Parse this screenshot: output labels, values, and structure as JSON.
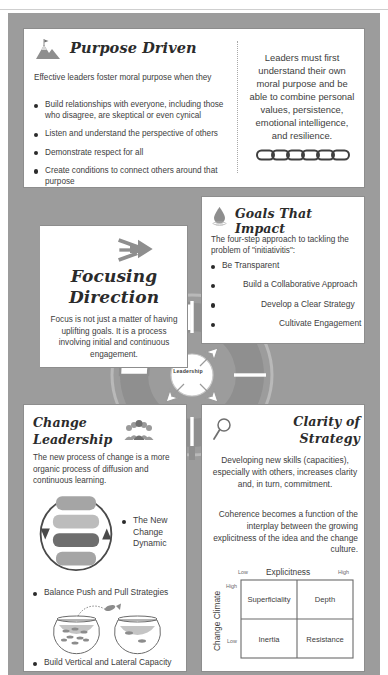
{
  "theme": {
    "frame_gray": "#9c9c9c",
    "ring_gray": "#8f8f8f",
    "card_border": "#8d8d8d",
    "text": "#3d3d3d",
    "title": "#2b2b2b"
  },
  "purpose": {
    "icon": "mountain-flag-icon",
    "title": "Purpose Driven",
    "lead": "Effective leaders foster moral purpose when they",
    "bullets": [
      "Build relationships with everyone, including those who disagree, are skeptical or even cynical",
      "Listen and understand the perspective of others",
      "Demonstrate respect for all",
      "Create conditions to connect others around that purpose"
    ],
    "callout": "Leaders must first understand their own moral purpose and be able to combine personal values, persistence, emotional intelligence, and resilience.",
    "callout_icon": "chain-links-icon"
  },
  "goals": {
    "icon": "water-droplet-icon",
    "title": "Goals That Impact",
    "lead": "The four-step approach to tackling the problem of \"initiativitis\":",
    "bullets": [
      "Be Transparent",
      "Build a Collaborative Approach",
      "Develop a Clear Strategy",
      "Cultivate Engagement"
    ]
  },
  "focus": {
    "icon": "converging-arrows-icon",
    "title_line1": "Focusing",
    "title_line2": "Direction",
    "body": "Focus is not just a matter of having uplifting goals. It is a process involving initial and continuous engagement."
  },
  "change": {
    "title_line1": "Change",
    "title_line2": "Leadership",
    "icon": "group-of-people-icon",
    "lead": "The new process of change is a more organic process of diffusion and continuous learning.",
    "cycle_icon": "change-cycle-diagram",
    "bullets": [
      "The New Change Dynamic",
      "Balance Push and Pull Strategies",
      "Build Vertical and Lateral Capacity"
    ],
    "bowls_icon": "fishbowls-jumping-fish-icon"
  },
  "clarity": {
    "icon": "magnifying-glass-icon",
    "title_line1": "Clarity of",
    "title_line2": "Strategy",
    "paragraph1": "Developing new skills (capacities), especially with others, increases clarity and, in turn, commitment.",
    "paragraph2": "Coherence becomes a function of the interplay between the growing explicitness of the idea and the change culture.",
    "matrix": {
      "x_axis": "Explicitness",
      "x_low": "Low",
      "x_high": "High",
      "y_axis": "Change Climate",
      "y_low": "Low",
      "y_high": "High",
      "cells": {
        "top_left": "Superficiality",
        "top_right": "Depth",
        "bottom_left": "Inertia",
        "bottom_right": "Resistance"
      }
    }
  },
  "ring": {
    "hub": "Leadership",
    "quadrants": [
      {
        "id": "focusing-direction",
        "label": ""
      },
      {
        "id": "cultivating-collaborative-cultures",
        "line1": "Cultivating",
        "line2": "Collaborative",
        "line3": "Cultures"
      },
      {
        "id": "deepening-learning",
        "line1": "Deepening",
        "line2": "Learning"
      },
      {
        "id": "securing-accountability",
        "line1": "Securing",
        "line2": "Accountability"
      }
    ]
  }
}
